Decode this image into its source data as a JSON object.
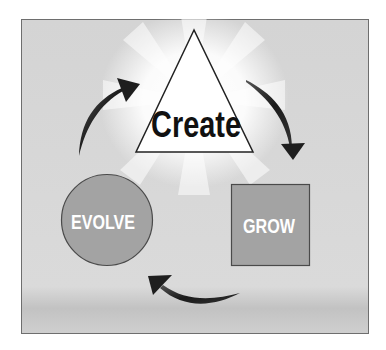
{
  "diagram": {
    "type": "cycle",
    "colors": {
      "background": "#d9d9d9",
      "frame_border": "#6e6e6e",
      "shape_fill": "#a3a3a3",
      "shape_stroke": "#4a4a4a",
      "triangle_fill": "#ffffff",
      "arrow": "#1e1e1e",
      "label_light": "#ffffff",
      "label_dark": "#111111"
    },
    "nodes": [
      {
        "id": "create",
        "shape": "triangle",
        "label": "Create"
      },
      {
        "id": "grow",
        "shape": "square",
        "label": "GROW"
      },
      {
        "id": "evolve",
        "shape": "circle",
        "label": "EVOLVE"
      }
    ],
    "edges": [
      {
        "from": "create",
        "to": "grow"
      },
      {
        "from": "grow",
        "to": "evolve"
      },
      {
        "from": "evolve",
        "to": "create"
      }
    ]
  }
}
